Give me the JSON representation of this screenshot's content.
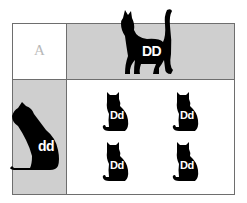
{
  "diagram": {
    "type": "punnett-square",
    "corner_label": "A",
    "top_parent": {
      "genotype": "DD",
      "pose": "standing-cat"
    },
    "left_parent": {
      "genotype": "dd",
      "pose": "sitting-cat"
    },
    "offspring": [
      {
        "genotype": "Dd"
      },
      {
        "genotype": "Dd"
      },
      {
        "genotype": "Dd"
      },
      {
        "genotype": "Dd"
      }
    ],
    "colors": {
      "header_bg": "#cfcfcf",
      "cell_bg": "#ffffff",
      "border": "#6e6e6e",
      "silhouette": "#000000",
      "label_text": "#ffffff",
      "corner_text": "#b8b8b8"
    }
  }
}
